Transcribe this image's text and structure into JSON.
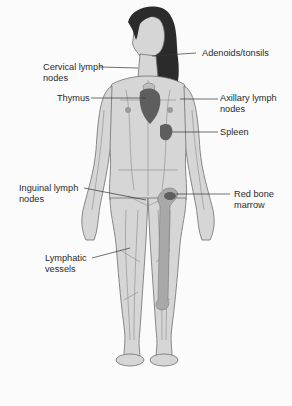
{
  "diagram": {
    "colors": {
      "background": "#fbfbfb",
      "skin": "#d6d6d6",
      "outline": "#6f6f6f",
      "vessels": "#8a8a8a",
      "hair": "#2b2b2b",
      "organ_dark": "#5e5e5e",
      "organ_mid": "#8c8c8c",
      "leader_line": "#333333",
      "text": "#2a2a2a"
    },
    "labels": [
      {
        "id": "adenoids",
        "text": "Adenoids/tonsils",
        "side": "right"
      },
      {
        "id": "cervical",
        "text": "Cervical lymph\nnodes",
        "side": "left"
      },
      {
        "id": "thymus",
        "text": "Thymus",
        "side": "left"
      },
      {
        "id": "axillary",
        "text": "Axillary lymph\nnodes",
        "side": "right"
      },
      {
        "id": "spleen",
        "text": "Spleen",
        "side": "right"
      },
      {
        "id": "inguinal",
        "text": "Inguinal lymph\nnodes",
        "side": "left"
      },
      {
        "id": "marrow",
        "text": "Red bone\nmarrow",
        "side": "right"
      },
      {
        "id": "vessels",
        "text": "Lymphatic\nvessels",
        "side": "left"
      }
    ]
  }
}
